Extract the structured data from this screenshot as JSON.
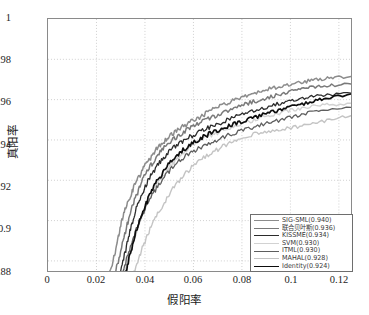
{
  "chart_data": {
    "type": "line",
    "title": "",
    "xlabel": "假阳率",
    "ylabel": "真阳率",
    "xlim": [
      0,
      0.125
    ],
    "ylim": [
      0.875,
      1.0
    ],
    "grid": true,
    "legend_position": "lower right",
    "xticks": [
      "0",
      "0.02",
      "0.04",
      "0.06",
      "0.08",
      "0.1",
      "0.12"
    ],
    "xtick_values": [
      0,
      0.02,
      0.04,
      0.06,
      0.08,
      0.1,
      0.12
    ],
    "yticks": [
      "0.88",
      "0.9",
      "0.92",
      "0.94",
      "0.96",
      "0.98",
      "1"
    ],
    "ytick_values": [
      0.88,
      0.9,
      0.92,
      0.94,
      0.96,
      0.98,
      1
    ],
    "series": [
      {
        "name": "SIG-SML(0.940)",
        "label": "SIG-SML(0.940)",
        "auc": 0.94,
        "color": "#8c8c8c",
        "width": 1.5,
        "x": [
          0.0255,
          0.0275,
          0.029,
          0.0305,
          0.032,
          0.0335,
          0.035,
          0.037,
          0.039,
          0.041,
          0.043,
          0.0455,
          0.048,
          0.0505,
          0.053,
          0.056,
          0.059,
          0.062,
          0.065,
          0.068,
          0.0715,
          0.075,
          0.0785,
          0.082,
          0.086,
          0.09,
          0.094,
          0.098,
          0.102,
          0.106,
          0.11,
          0.1145,
          0.119,
          0.125
        ],
        "y": [
          0.875,
          0.883,
          0.892,
          0.9,
          0.9065,
          0.911,
          0.9155,
          0.9205,
          0.925,
          0.929,
          0.9325,
          0.9365,
          0.9395,
          0.942,
          0.9445,
          0.947,
          0.949,
          0.951,
          0.953,
          0.955,
          0.957,
          0.959,
          0.9605,
          0.962,
          0.9635,
          0.965,
          0.966,
          0.967,
          0.968,
          0.969,
          0.9698,
          0.9705,
          0.971,
          0.9715
        ]
      },
      {
        "name": "联合贝叶斯(0.936)",
        "label": "联合贝叶斯(0.936)",
        "auc": 0.936,
        "color": "#7a7a7a",
        "width": 1.5,
        "x": [
          0.028,
          0.03,
          0.032,
          0.034,
          0.036,
          0.038,
          0.04,
          0.0425,
          0.045,
          0.0475,
          0.05,
          0.053,
          0.056,
          0.059,
          0.062,
          0.0655,
          0.069,
          0.0725,
          0.076,
          0.08,
          0.084,
          0.088,
          0.092,
          0.096,
          0.1,
          0.104,
          0.108,
          0.1125,
          0.117,
          0.125
        ],
        "y": [
          0.875,
          0.885,
          0.895,
          0.904,
          0.911,
          0.917,
          0.9225,
          0.9275,
          0.932,
          0.9355,
          0.9385,
          0.9415,
          0.944,
          0.9462,
          0.9482,
          0.95,
          0.9518,
          0.9535,
          0.9552,
          0.957,
          0.9588,
          0.9602,
          0.9615,
          0.9628,
          0.964,
          0.965,
          0.9658,
          0.9665,
          0.967,
          0.9678
        ]
      },
      {
        "name": "KISSME(0.934)",
        "label": "KISSME(0.934)",
        "auc": 0.934,
        "color": "#2b2b2b",
        "width": 1.3,
        "x": [
          0.03,
          0.0318,
          0.0335,
          0.0352,
          0.037,
          0.039,
          0.0412,
          0.0435,
          0.046,
          0.0485,
          0.0512,
          0.054,
          0.057,
          0.06,
          0.0632,
          0.0665,
          0.07,
          0.0738,
          0.0776,
          0.0815,
          0.0855,
          0.0896,
          0.0938,
          0.098,
          0.1022,
          0.1065,
          0.111,
          0.116,
          0.125
        ],
        "y": [
          0.875,
          0.884,
          0.893,
          0.901,
          0.908,
          0.914,
          0.9195,
          0.9245,
          0.929,
          0.9325,
          0.9355,
          0.9382,
          0.9405,
          0.9425,
          0.9445,
          0.9462,
          0.948,
          0.9498,
          0.9515,
          0.9532,
          0.9548,
          0.9562,
          0.9575,
          0.9588,
          0.96,
          0.961,
          0.9618,
          0.9625,
          0.9632
        ]
      },
      {
        "name": "SVM(0.930)",
        "label": "SVM(0.930)",
        "auc": 0.93,
        "color": "#d2d2d2",
        "width": 1.4,
        "x": [
          0.0315,
          0.0335,
          0.0355,
          0.0378,
          0.04,
          0.0425,
          0.045,
          0.0478,
          0.0505,
          0.0535,
          0.0565,
          0.0598,
          0.0632,
          0.0668,
          0.0705,
          0.0745,
          0.0785,
          0.0828,
          0.0872,
          0.0916,
          0.0962,
          0.1008,
          0.1055,
          0.1105,
          0.116,
          0.125
        ],
        "y": [
          0.875,
          0.883,
          0.8912,
          0.899,
          0.906,
          0.9122,
          0.9178,
          0.9228,
          0.9272,
          0.931,
          0.9342,
          0.9372,
          0.9398,
          0.942,
          0.944,
          0.9458,
          0.9475,
          0.9492,
          0.9508,
          0.9522,
          0.9536,
          0.9548,
          0.9558,
          0.9568,
          0.9575,
          0.9582
        ]
      },
      {
        "name": "ITML(0.930)",
        "label": "ITML(0.930)",
        "auc": 0.93,
        "color": "#5e5e5e",
        "width": 1.3,
        "x": [
          0.031,
          0.033,
          0.035,
          0.0372,
          0.0395,
          0.042,
          0.0448,
          0.0475,
          0.0505,
          0.0535,
          0.0568,
          0.0602,
          0.0638,
          0.0675,
          0.0715,
          0.0756,
          0.0798,
          0.0842,
          0.0888,
          0.0935,
          0.0982,
          0.103,
          0.108,
          0.1135,
          0.125
        ],
        "y": [
          0.875,
          0.8828,
          0.8905,
          0.8978,
          0.9045,
          0.9105,
          0.916,
          0.9208,
          0.9252,
          0.9288,
          0.9318,
          0.9345,
          0.9368,
          0.939,
          0.941,
          0.9428,
          0.9445,
          0.9462,
          0.9478,
          0.9492,
          0.9506,
          0.952,
          0.9535,
          0.9548,
          0.9562
        ]
      },
      {
        "name": "MAHAL(0.928)",
        "label": "MAHAL(0.928)",
        "auc": 0.928,
        "color": "#c4c4c4",
        "width": 1.4,
        "x": [
          0.0355,
          0.0378,
          0.04,
          0.0425,
          0.0452,
          0.048,
          0.051,
          0.0542,
          0.0575,
          0.061,
          0.0648,
          0.0688,
          0.0728,
          0.077,
          0.0815,
          0.0862,
          0.091,
          0.096,
          0.1012,
          0.1065,
          0.112,
          0.118,
          0.125
        ],
        "y": [
          0.875,
          0.8825,
          0.8898,
          0.8968,
          0.9032,
          0.9092,
          0.9148,
          0.9198,
          0.9242,
          0.9282,
          0.9315,
          0.9345,
          0.9372,
          0.9395,
          0.9415,
          0.9432,
          0.9445,
          0.9455,
          0.9462,
          0.9472,
          0.9488,
          0.9505,
          0.952
        ]
      },
      {
        "name": "Identity(0.924)",
        "label": "Identity(0.924)",
        "auc": 0.924,
        "color": "#0d0d0d",
        "width": 1.7,
        "x": [
          0.0322,
          0.034,
          0.0358,
          0.0378,
          0.0398,
          0.042,
          0.0444,
          0.047,
          0.0496,
          0.0524,
          0.0552,
          0.0582,
          0.0614,
          0.0646,
          0.068,
          0.0716,
          0.0752,
          0.079,
          0.083,
          0.0872,
          0.0914,
          0.0958,
          0.1002,
          0.1048,
          0.1096,
          0.1146,
          0.125
        ],
        "y": [
          0.875,
          0.8838,
          0.8922,
          0.9,
          0.9068,
          0.9128,
          0.9182,
          0.9232,
          0.9275,
          0.9312,
          0.9345,
          0.9372,
          0.9396,
          0.9418,
          0.9438,
          0.9455,
          0.9472,
          0.9488,
          0.9504,
          0.952,
          0.9536,
          0.955,
          0.9565,
          0.9578,
          0.9592,
          0.9605,
          0.9628
        ]
      }
    ]
  },
  "legend": {
    "items": [
      {
        "label": "SIG-SML(0.940)"
      },
      {
        "label": "联合贝叶斯(0.936)"
      },
      {
        "label": "KISSME(0.934)"
      },
      {
        "label": "SVM(0.930)"
      },
      {
        "label": "ITML(0.930)"
      },
      {
        "label": "MAHAL(0.928)"
      },
      {
        "label": "Identity(0.924)"
      }
    ]
  }
}
